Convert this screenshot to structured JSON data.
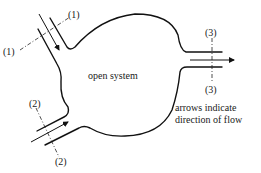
{
  "diagram": {
    "system_label": "open system",
    "note_line1": "arrows indicate",
    "note_line2": "direction of flow",
    "sections": [
      {
        "id": 1,
        "label_top": "(1)",
        "label_bottom": "(1)"
      },
      {
        "id": 2,
        "label_top": "(2)",
        "label_bottom": "(2)"
      },
      {
        "id": 3,
        "label_top": "(3)",
        "label_bottom": "(3)"
      }
    ],
    "colors": {
      "line": "#111111",
      "background": "#ffffff"
    }
  }
}
